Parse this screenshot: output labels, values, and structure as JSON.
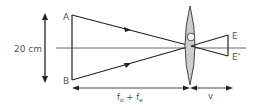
{
  "diagram": {
    "size_label": "20 cm",
    "points": {
      "A": "A",
      "B": "B",
      "E": "E",
      "E_prime": "E'"
    },
    "distance_labels": {
      "objective_plus_eyepiece": {
        "f": "f",
        "sub_o": "o",
        "plus": " + ",
        "f2": "f",
        "sub_e": "e"
      },
      "image_distance": "v"
    },
    "colors": {
      "line": "#222222",
      "lens_fill": "#cfcfcf",
      "text": "#555555"
    }
  }
}
